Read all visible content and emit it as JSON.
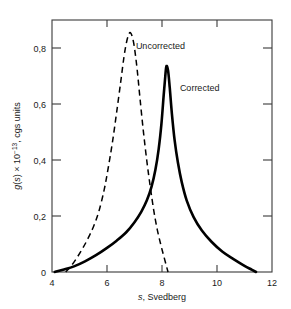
{
  "chart_data": {
    "type": "line",
    "title": "",
    "xlabel": "s, Svedberg",
    "ylabel": "g(s) × 10⁻¹³, cgs units",
    "xlim": [
      4,
      12
    ],
    "ylim": [
      0,
      0.9
    ],
    "grid": false,
    "legend_position": "inline-annotations",
    "xticks": [
      "4",
      "6",
      "8",
      "10",
      "12"
    ],
    "xtick_values": [
      4,
      6,
      8,
      10,
      12
    ],
    "yticks": [
      "0",
      "0,2",
      "0,4",
      "0,6",
      "0,8"
    ],
    "ytick_values": [
      0,
      0.2,
      0.4,
      0.6,
      0.8
    ],
    "series": [
      {
        "name": "Uncorrected",
        "style": "dashed",
        "color": "#000000",
        "peak_x": 6.85,
        "peak_y": 0.855,
        "x": [
          4.5,
          4.7,
          4.9,
          5.1,
          5.3,
          5.5,
          5.7,
          5.9,
          6.05,
          6.2,
          6.35,
          6.5,
          6.62,
          6.72,
          6.8,
          6.85,
          6.92,
          7.0,
          7.1,
          7.2,
          7.32,
          7.45,
          7.58,
          7.7,
          7.82,
          7.95,
          8.05,
          8.15,
          8.22
        ],
        "y": [
          0.0,
          0.022,
          0.05,
          0.082,
          0.118,
          0.16,
          0.215,
          0.295,
          0.375,
          0.465,
          0.57,
          0.68,
          0.77,
          0.825,
          0.85,
          0.855,
          0.84,
          0.8,
          0.72,
          0.62,
          0.505,
          0.395,
          0.3,
          0.22,
          0.155,
          0.1,
          0.062,
          0.025,
          0.0
        ]
      },
      {
        "name": "Corrected",
        "style": "solid",
        "color": "#000000",
        "peak_x": 8.15,
        "peak_y": 0.735,
        "x": [
          4.1,
          4.4,
          4.8,
          5.2,
          5.6,
          6.0,
          6.35,
          6.7,
          7.0,
          7.25,
          7.45,
          7.62,
          7.76,
          7.88,
          7.98,
          8.06,
          8.12,
          8.16,
          8.22,
          8.28,
          8.36,
          8.46,
          8.58,
          8.72,
          8.9,
          9.15,
          9.45,
          9.8,
          10.2,
          10.6,
          11.0,
          11.25,
          11.42
        ],
        "y": [
          0.0,
          0.008,
          0.02,
          0.038,
          0.06,
          0.086,
          0.112,
          0.142,
          0.178,
          0.216,
          0.256,
          0.305,
          0.365,
          0.44,
          0.53,
          0.63,
          0.7,
          0.735,
          0.72,
          0.66,
          0.565,
          0.47,
          0.39,
          0.32,
          0.255,
          0.196,
          0.148,
          0.108,
          0.072,
          0.046,
          0.022,
          0.009,
          0.0
        ]
      }
    ],
    "annotations": [
      {
        "text": "Uncorrected",
        "x": 7.05,
        "y": 0.795
      },
      {
        "text": "Corrected",
        "x": 8.65,
        "y": 0.645
      }
    ]
  }
}
